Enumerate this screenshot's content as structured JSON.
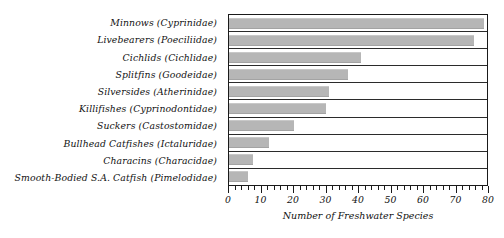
{
  "chart_data": {
    "type": "bar",
    "orientation": "horizontal",
    "title": "",
    "xlabel": "Number of Freshwater Species",
    "ylabel": "",
    "xlim": [
      0,
      80
    ],
    "xticks": [
      0,
      10,
      20,
      30,
      40,
      50,
      60,
      70,
      80
    ],
    "minor_tick_step": 2,
    "grid": false,
    "legend": false,
    "bar_color": "#b6b6b6",
    "border_color": "#1a1a1a",
    "categories": [
      "Minnows (Cyprinidae)",
      "Livebearers (Poeciliidae)",
      "Cichlids (Cichlidae)",
      "Splitfins (Goodeidae)",
      "Silversides (Atherinidae)",
      "Killifishes (Cyprinodontidae)",
      "Suckers (Castostomidae)",
      "Bullhead Catfishes (Ictaluridae)",
      "Characins (Characidae)",
      "Smooth-Bodied S.A. Catfish (Pimelodidae)"
    ],
    "values": [
      79,
      76,
      41,
      37,
      31,
      30,
      20,
      12.5,
      7.5,
      6
    ]
  }
}
